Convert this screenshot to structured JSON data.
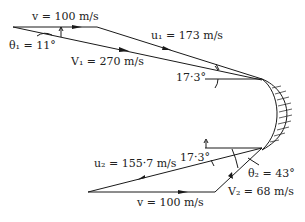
{
  "diagram": {
    "type": "velocity-triangles-turbine-blade",
    "inlet": {
      "blade_speed": {
        "symbol": "v",
        "value": "100 m/s",
        "label": "v = 100 m/s"
      },
      "absolute_velocity": {
        "symbol": "V₁",
        "value": "270 m/s",
        "label": "V₁ = 270 m/s"
      },
      "relative_velocity": {
        "symbol": "u₁",
        "value": "173 m/s",
        "label": "u₁ = 173 m/s"
      },
      "nozzle_angle": {
        "symbol": "θ₁",
        "value": "11°",
        "label": "θ₁ = 11°"
      },
      "blade_angle": {
        "label": "17·3°"
      }
    },
    "outlet": {
      "blade_speed": {
        "symbol": "v",
        "value": "100 m/s",
        "label": "v = 100 m/s"
      },
      "absolute_velocity": {
        "symbol": "V₂",
        "value": "68 m/s",
        "label": "V₂ = 68 m/s"
      },
      "relative_velocity": {
        "symbol": "u₂",
        "value": "155·7 m/s",
        "label": "u₂ = 155·7 m/s"
      },
      "exit_angle": {
        "symbol": "θ₂",
        "value": "43°",
        "label": "θ₂ = 43°"
      },
      "blade_angle": {
        "label": "17·3°"
      }
    },
    "colors": {
      "line": "#1a1a1a",
      "text": "#222222",
      "background": "#ffffff"
    }
  }
}
